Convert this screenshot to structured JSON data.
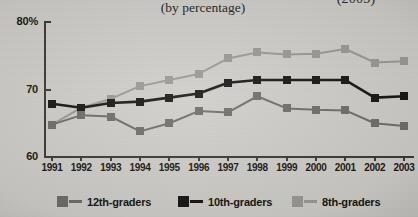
{
  "header": {
    "title_clipped": "(2003)",
    "subtitle": "(by percentage)"
  },
  "legend": {
    "position": "bottom",
    "items": [
      {
        "label": "12th-graders",
        "color": "#6e6c68"
      },
      {
        "label": "10th-graders",
        "color": "#151311"
      },
      {
        "label": "8th-graders",
        "color": "#9a9893"
      }
    ]
  },
  "axes": {
    "y_ticks": [
      "80%",
      "70",
      "60"
    ],
    "x_ticks": [
      "1991",
      "1992",
      "1993",
      "1994",
      "1995",
      "1996",
      "1997",
      "1998",
      "1999",
      "2000",
      "2001",
      "2002",
      "2003"
    ]
  },
  "chart_data": {
    "type": "line",
    "title": "(2003)",
    "subtitle": "(by percentage)",
    "xlabel": "",
    "ylabel": "",
    "ylim": [
      60,
      80
    ],
    "grid": false,
    "legend_position": "bottom",
    "categories": [
      "1991",
      "1992",
      "1993",
      "1994",
      "1995",
      "1996",
      "1997",
      "1998",
      "1999",
      "2000",
      "2001",
      "2002",
      "2003"
    ],
    "series": [
      {
        "name": "8th-graders",
        "color": "#9a9893",
        "values": [
          64.8,
          67.3,
          68.6,
          70.5,
          71.4,
          72.3,
          74.6,
          75.5,
          75.2,
          75.3,
          76.0,
          74.0,
          74.2
        ]
      },
      {
        "name": "10th-graders",
        "color": "#151311",
        "values": [
          67.9,
          67.3,
          68.0,
          68.2,
          68.8,
          69.4,
          71.0,
          71.4,
          71.4,
          71.4,
          71.4,
          68.8,
          69.0
        ]
      },
      {
        "name": "12th-graders",
        "color": "#6e6c68",
        "values": [
          64.8,
          66.2,
          66.0,
          63.8,
          65.0,
          66.8,
          66.6,
          69.0,
          67.2,
          67.0,
          66.9,
          65.0,
          64.6
        ]
      }
    ]
  }
}
